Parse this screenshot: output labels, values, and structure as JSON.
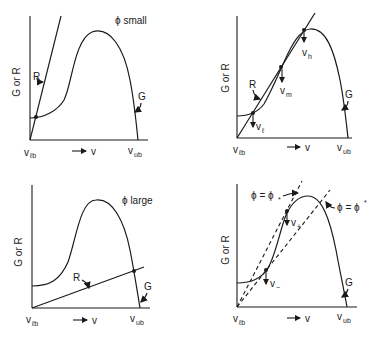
{
  "figure": {
    "panels": [
      {
        "id": "top-left",
        "annotation": "ϕ small",
        "y_label": "G or R",
        "x_left": "v",
        "x_left_sub": "ℓb",
        "x_arrow": "→ v",
        "x_right": "v",
        "x_right_sub": "ub",
        "curve_labels": [
          "R",
          "G"
        ]
      },
      {
        "id": "top-right",
        "y_label": "G or R",
        "x_left": "v",
        "x_left_sub": "ℓb",
        "x_arrow": "→ v",
        "x_right": "v",
        "x_right_sub": "ub",
        "curve_labels": [
          "R",
          "G"
        ],
        "points": [
          {
            "label": "v",
            "sub": "h"
          },
          {
            "label": "v",
            "sub": "m"
          },
          {
            "label": "v",
            "sub": "ℓ"
          }
        ]
      },
      {
        "id": "bottom-left",
        "annotation": "ϕ large",
        "y_label": "G or R",
        "x_left": "v",
        "x_left_sub": "ℓb",
        "x_arrow": "→ v",
        "x_right": "v",
        "x_right_sub": "ub",
        "curve_labels": [
          "R",
          "G"
        ]
      },
      {
        "id": "bottom-right",
        "y_label": "G or R",
        "x_left": "v",
        "x_left_sub": "ℓb",
        "x_arrow": "→ v",
        "x_right": "v",
        "x_right_sub": "ub",
        "curve_labels": [
          "G"
        ],
        "lines": [
          {
            "label": "ϕ = ϕ",
            "sub": "*"
          },
          {
            "label": "ϕ = ϕ",
            "sup": "*"
          }
        ],
        "points": [
          {
            "label": "v",
            "sub": "+"
          },
          {
            "label": "v",
            "sub": "−"
          }
        ]
      }
    ]
  }
}
